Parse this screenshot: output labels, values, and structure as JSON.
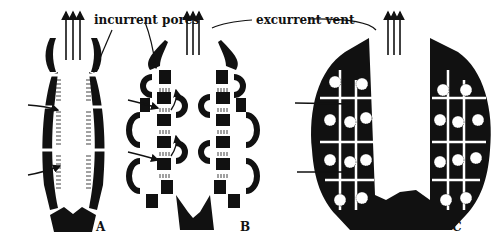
{
  "diagram": {
    "labels": {
      "incurrent": "incurrent pores",
      "excurrent": "excurrent vent"
    },
    "panels": [
      {
        "id": "A",
        "label": "A"
      },
      {
        "id": "B",
        "label": "B"
      },
      {
        "id": "C",
        "label": "C"
      }
    ],
    "colors": {
      "fill": "#111111",
      "background": "#ffffff"
    }
  }
}
